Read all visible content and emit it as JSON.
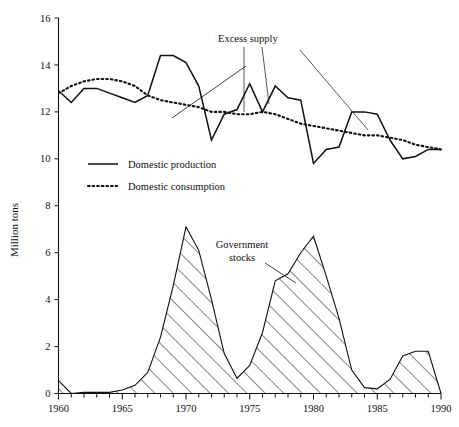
{
  "chart_data": {
    "type": "line",
    "title": "",
    "xlabel": "",
    "ylabel": "Million tons",
    "xlim": [
      1960,
      1990
    ],
    "ylim": [
      0,
      16
    ],
    "ytick_values": [
      0,
      2,
      4,
      6,
      8,
      10,
      12,
      14,
      16
    ],
    "ytick_labels": [
      "0",
      "2",
      "4",
      "6",
      "8",
      "10",
      "12",
      "14",
      "16"
    ],
    "xtick_values": [
      1960,
      1965,
      1970,
      1975,
      1980,
      1985,
      1990
    ],
    "xtick_labels": [
      "1960",
      "1965",
      "1970",
      "1975",
      "1980",
      "1985",
      "1990"
    ],
    "xtick_minor_step": 1,
    "grid": false,
    "legend_position": "upper-left-inside",
    "x": [
      1960,
      1961,
      1962,
      1963,
      1964,
      1965,
      1966,
      1967,
      1968,
      1969,
      1970,
      1971,
      1972,
      1973,
      1974,
      1975,
      1976,
      1977,
      1978,
      1979,
      1980,
      1981,
      1982,
      1983,
      1984,
      1985,
      1986,
      1987,
      1988,
      1989,
      1990
    ],
    "series": [
      {
        "name": "Domestic production",
        "style": "solid",
        "values": [
          12.9,
          12.4,
          13.0,
          13.0,
          12.8,
          12.6,
          12.4,
          12.7,
          14.4,
          14.4,
          14.1,
          13.1,
          10.8,
          11.9,
          12.1,
          13.2,
          12.0,
          13.1,
          12.6,
          12.5,
          9.8,
          10.4,
          10.5,
          12.0,
          12.0,
          11.9,
          10.8,
          10.0,
          10.1,
          10.4,
          10.4
        ]
      },
      {
        "name": "Domestic consumption",
        "style": "dotted",
        "values": [
          12.8,
          13.1,
          13.3,
          13.4,
          13.4,
          13.3,
          13.1,
          12.7,
          12.5,
          12.4,
          12.3,
          12.2,
          12.0,
          12.0,
          11.9,
          11.9,
          12.0,
          11.9,
          11.7,
          11.5,
          11.4,
          11.3,
          11.2,
          11.1,
          11.0,
          11.0,
          10.9,
          10.8,
          10.6,
          10.5,
          10.4
        ]
      },
      {
        "name": "Government stocks",
        "style": "hatched-area",
        "values": [
          0.55,
          0.0,
          0.05,
          0.05,
          0.05,
          0.15,
          0.35,
          0.9,
          2.4,
          4.6,
          7.1,
          6.1,
          4.0,
          1.7,
          0.65,
          1.2,
          2.6,
          4.8,
          5.1,
          6.0,
          6.7,
          5.0,
          3.2,
          1.0,
          0.25,
          0.2,
          0.6,
          1.6,
          1.8,
          1.8,
          0.0
        ]
      }
    ],
    "annotations": [
      {
        "name": "excess-supply",
        "text": "Excess supply"
      },
      {
        "name": "government-stocks",
        "text": "Government\nstocks",
        "line1": "Government",
        "line2": "stocks"
      }
    ]
  },
  "legend": {
    "items": [
      {
        "label": "Domestic production",
        "style": "solid"
      },
      {
        "label": "Domestic consumption",
        "style": "dotted"
      }
    ]
  },
  "axes": {
    "y_title": "Million tons"
  },
  "colors": {
    "ink": "#111111",
    "background": "#ffffff"
  }
}
